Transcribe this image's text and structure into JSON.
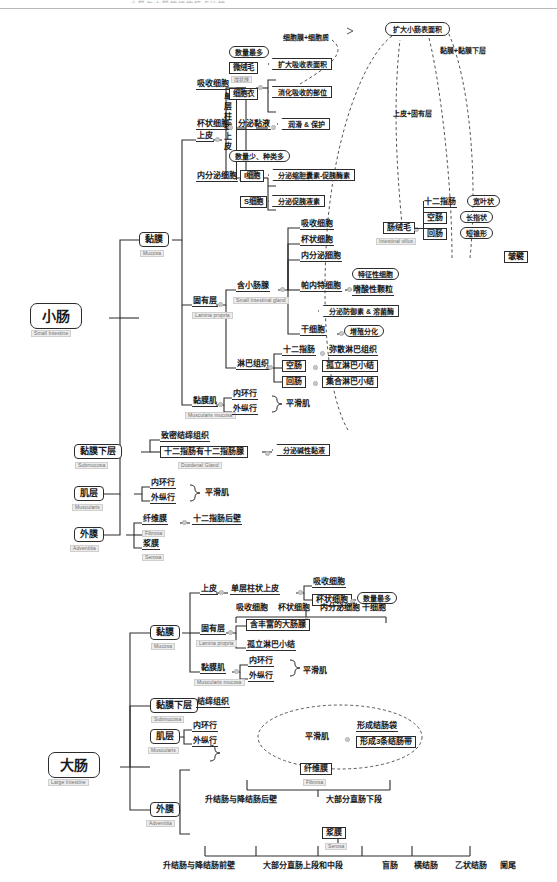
{
  "document": {
    "top_cut_text": "小肠与大肠的结构特点比较",
    "title_hidden": true
  },
  "small_intestine": {
    "root": {
      "cn": "小肠",
      "en": "Small Intestine"
    },
    "mucosa": {
      "cn": "黏膜",
      "en": "Mucosa",
      "epithelium": {
        "label": "上皮",
        "type": "单层柱状上皮",
        "cells": [
          {
            "name": "吸收细胞",
            "note": "数量最多",
            "children": [
              {
                "name": "微绒毛",
                "sub": "纹状缘",
                "desc": "扩大吸收表面积"
              },
              {
                "name": "细胞衣",
                "desc": "消化吸收的部位"
              }
            ]
          },
          {
            "name": "杯状细胞",
            "children": [
              {
                "name": "分泌黏液",
                "desc": "润滑 & 保护"
              }
            ]
          },
          {
            "name": "内分泌细胞",
            "note": "数量少、种类多",
            "children": [
              {
                "name": "I细胞",
                "desc": "分泌缩胆囊素-促胰酶素"
              },
              {
                "name": "S细胞",
                "desc": "分泌促胰液素"
              }
            ]
          }
        ]
      },
      "lamina_propria": {
        "cn": "固有层",
        "en": "Lamina propria",
        "gland": {
          "cn": "含小肠腺",
          "en": "Small Intestinal gland",
          "cells_plain": [
            "吸收细胞",
            "杯状细胞",
            "内分泌细胞"
          ],
          "paneth": {
            "name": "帕内特细胞",
            "notes": [
              "特征性细胞",
              "嗜酸性颗粒",
              "分泌防御素 & 溶菌酶"
            ]
          },
          "stem": {
            "name": "干细胞",
            "desc": "增殖分化"
          }
        },
        "lymphoid": {
          "label": "淋巴组织",
          "rows": [
            {
              "seg": "十二指肠",
              "val": "弥散淋巴组织"
            },
            {
              "seg": "空肠",
              "val": "孤立淋巴小结"
            },
            {
              "seg": "回肠",
              "val": "集合淋巴小结"
            }
          ]
        }
      },
      "muscularis_mucosa": {
        "cn": "黏膜肌",
        "en": "Muscularis mucosa",
        "layers": [
          "内环行",
          "外纵行"
        ],
        "tissue": "平滑肌"
      }
    },
    "submucosa": {
      "cn": "黏膜下层",
      "en": "Submucosa",
      "tissue": "致密结缔组织",
      "gland": {
        "cn": "十二指肠有十二指肠腺",
        "en": "Duodenal Gland",
        "desc": "分泌碱性黏液"
      }
    },
    "muscularis": {
      "cn": "肌层",
      "en": "Muscularis",
      "layers": [
        "内环行",
        "外纵行"
      ],
      "tissue": "平滑肌"
    },
    "adventitia": {
      "cn": "外膜",
      "en": "Adventitia",
      "fibrosa": {
        "cn": "纤维膜",
        "en": "Fibrosa",
        "desc": "十二指肠后壁"
      },
      "serosa": {
        "cn": "浆膜",
        "en": "Serosa"
      }
    },
    "right_panel": {
      "goal": "扩大小肠表面积",
      "from_cell": "细胞膜+细胞质",
      "from_epi": "上皮+固有层",
      "from_muc": "黏膜+黏膜下层",
      "villus": {
        "cn": "肠绒毛",
        "en": "Intestinal villus"
      },
      "villus_shapes": [
        {
          "seg": "十二指肠",
          "shape": "宽叶状"
        },
        {
          "seg": "空肠",
          "shape": "长指状"
        },
        {
          "seg": "回肠",
          "shape": "短锥形"
        }
      ],
      "plica": "皱襞"
    }
  },
  "large_intestine": {
    "root": {
      "cn": "大肠",
      "en": "Large Intestine"
    },
    "mucosa": {
      "cn": "黏膜",
      "en": "Mucosa",
      "epithelium": {
        "label": "上皮",
        "type": "单层柱状上皮",
        "cells": [
          "吸收细胞",
          "杯状细胞"
        ],
        "goblet_note": "数量最多"
      },
      "gland_cells": [
        "吸收细胞",
        "杯状细胞",
        "内分泌细胞",
        "干细胞"
      ],
      "lamina_propria": {
        "cn": "固有层",
        "en": "Lamina propria",
        "items": [
          "含丰富的大肠腺",
          "孤立淋巴小结"
        ]
      },
      "muscularis_mucosa": {
        "cn": "黏膜肌",
        "en": "Muscularis mucosa",
        "layers": [
          "内环行",
          "外纵行"
        ],
        "tissue": "平滑肌"
      }
    },
    "submucosa": {
      "cn": "黏膜下层",
      "en": "Submucosa",
      "tissue": "结缔组织"
    },
    "muscularis": {
      "cn": "肌层",
      "en": "Muscularis",
      "layers": [
        "内环行",
        "外纵行"
      ],
      "tissue": "平滑肌",
      "results": [
        "形成结肠袋",
        "形成3条结肠带"
      ]
    },
    "adventitia": {
      "cn": "外膜",
      "en": "Adventitia",
      "fibrosa": {
        "cn": "纤维膜",
        "en": "Fibrosa",
        "sites": [
          "升结肠与降结肠后壁",
          "大部分直肠下段"
        ]
      },
      "serosa": {
        "cn": "浆膜",
        "en": "Serosa",
        "sites": [
          "升结肠与降结肠前壁",
          "大部分直肠上段和中段",
          "盲肠",
          "横结肠",
          "乙状结肠",
          "阑尾"
        ]
      }
    }
  },
  "colors": {
    "line": "#2c2c2c",
    "en_text": "#6f6f6f",
    "en_bg": "#ececec",
    "dashed": "#555555"
  }
}
